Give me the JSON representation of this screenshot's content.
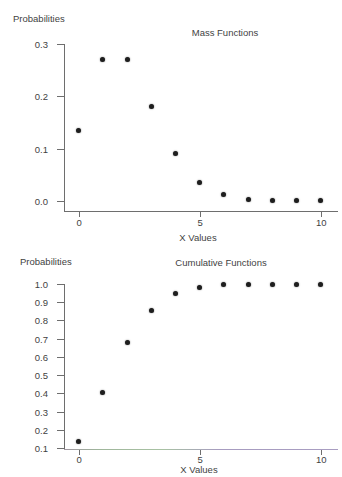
{
  "figure": {
    "background": "#ffffff",
    "text_color": "#3f3f3f",
    "axis_color": "#6e6e6e",
    "point_color": "#1e1e1e"
  },
  "chart_data": [
    {
      "type": "scatter",
      "title": "Mass Functions",
      "ylabel": "Probabilities",
      "xlabel": "X Values",
      "x": [
        0,
        1,
        2,
        3,
        4,
        5,
        6,
        7,
        8,
        9,
        10
      ],
      "y": [
        0.135,
        0.271,
        0.271,
        0.18,
        0.09,
        0.036,
        0.012,
        0.003,
        0.001,
        0.0003,
        0.0001
      ],
      "xlim": [
        0,
        10
      ],
      "ylim": [
        0.0,
        0.3
      ],
      "xticks": [
        0,
        5,
        10
      ],
      "xtick_labels": [
        "0",
        "5",
        "10"
      ],
      "yticks": [
        0.3,
        0.2,
        0.1,
        0.0
      ],
      "ytick_labels": [
        "0.3",
        "0.2",
        "0.1",
        "0.0"
      ],
      "grid": false,
      "legend": null
    },
    {
      "type": "scatter",
      "title": "Cumulative Functions",
      "ylabel": "Probabilities",
      "xlabel": "X Values",
      "x": [
        0,
        1,
        2,
        3,
        4,
        5,
        6,
        7,
        8,
        9,
        10
      ],
      "y": [
        0.135,
        0.406,
        0.677,
        0.857,
        0.947,
        0.983,
        0.995,
        0.999,
        1.0,
        1.0,
        1.0
      ],
      "xlim": [
        0,
        10
      ],
      "ylim": [
        0.1,
        1.0
      ],
      "xticks": [
        0,
        5,
        10
      ],
      "xtick_labels": [
        "0",
        "5",
        "10"
      ],
      "yticks": [
        1.0,
        0.9,
        0.8,
        0.7,
        0.6,
        0.5,
        0.4,
        0.3,
        0.2,
        0.1
      ],
      "ytick_labels": [
        "1.0",
        "0.9",
        "0.8",
        "0.7",
        "0.6",
        "0.5",
        "0.4",
        "0.3",
        "0.2",
        "0.1"
      ],
      "grid": false,
      "legend": null
    }
  ]
}
